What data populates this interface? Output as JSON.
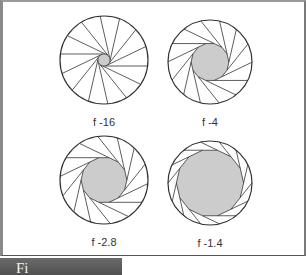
{
  "figure": {
    "caption_partial": "Fi",
    "colors": {
      "outline": "#333333",
      "aperture_fill": "#cccccc",
      "background": "#ffffff",
      "caption_bar": "#5a5a5a"
    },
    "apertures": [
      {
        "label": "f -16",
        "cx": 104,
        "cy": 60,
        "r": 44,
        "opening_ratio": 0.14,
        "blades": 14
      },
      {
        "label": "f -4",
        "cx": 210,
        "cy": 62,
        "r": 42,
        "opening_ratio": 0.45,
        "blades": 14
      },
      {
        "label": "f -2.8",
        "cx": 104,
        "cy": 180,
        "r": 44,
        "opening_ratio": 0.52,
        "blades": 14
      },
      {
        "label": "f -1.4",
        "cx": 210,
        "cy": 183,
        "r": 42,
        "opening_ratio": 0.8,
        "blades": 14
      }
    ],
    "label_offsets_y": 26
  }
}
